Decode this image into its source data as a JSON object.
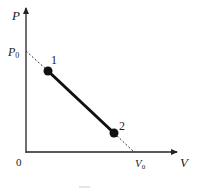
{
  "diagram": {
    "axes": {
      "y_label": "P",
      "x_label": "V",
      "origin_label": "0",
      "y_intercept_label": "P",
      "y_intercept_sub": "0",
      "x_intercept_label": "V",
      "x_intercept_sub": "0"
    },
    "points": [
      {
        "label": "1"
      },
      {
        "label": "2"
      }
    ],
    "caption": "",
    "colors": {
      "line": "#111111",
      "axis": "#222222",
      "dashed": "#333333"
    }
  }
}
